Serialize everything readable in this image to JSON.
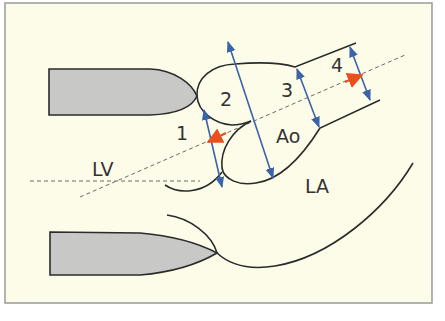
{
  "figure": {
    "colors": {
      "background": "#fdfce9",
      "frame": "#9a9a98",
      "outline": "#2b2b2b",
      "septum_fill": "#c8c8c6",
      "measure_arrow": "#3a63a8",
      "flow_arrow": "#e8501e",
      "dashed": "#6a6a6a"
    },
    "labels": {
      "level_1": "1",
      "level_2": "2",
      "level_3": "3",
      "level_4": "4",
      "aorta": "Ao",
      "left_ventricle": "LV",
      "left_atrium": "LA"
    },
    "measurement_levels": [
      {
        "id": "1",
        "name": "aortic annulus"
      },
      {
        "id": "2",
        "name": "sinus of Valsalva"
      },
      {
        "id": "3",
        "name": "sinotubular junction"
      },
      {
        "id": "4",
        "name": "ascending aorta"
      }
    ]
  }
}
